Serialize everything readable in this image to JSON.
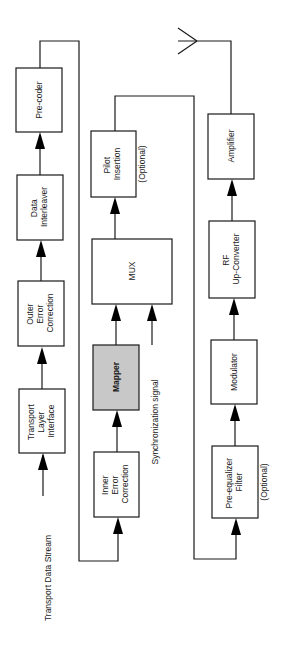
{
  "diagram": {
    "title": "",
    "orientation": "rotated-90-ccw",
    "highlight_color": "#c8c8c8",
    "line_color": "#1a1a1a",
    "blocks": [
      {
        "id": "transport-layer-interface",
        "lines": [
          "Transport",
          "Layer",
          "Interface"
        ]
      },
      {
        "id": "outer-error-correction",
        "lines": [
          "Outer",
          "Error",
          "Correction"
        ]
      },
      {
        "id": "data-interleaver",
        "lines": [
          "Data",
          "Interleaver"
        ]
      },
      {
        "id": "pre-coder",
        "lines": [
          "Pre-coder"
        ]
      },
      {
        "id": "inner-error-correction",
        "lines": [
          "Inner",
          "Error",
          "Correction"
        ]
      },
      {
        "id": "mapper",
        "lines": [
          "Mapper"
        ],
        "highlighted": true
      },
      {
        "id": "mux",
        "lines": [
          "MUX"
        ]
      },
      {
        "id": "pilot-insertion",
        "lines": [
          "Pilot",
          "Insertion"
        ],
        "note": "(Optional)"
      },
      {
        "id": "pre-equalizer-filter",
        "lines": [
          "Pre-equalizer",
          "Filter"
        ],
        "note": "(Optional)"
      },
      {
        "id": "modulator",
        "lines": [
          "Modulator"
        ]
      },
      {
        "id": "rf-up-converter",
        "lines": [
          "RF",
          "Up-Converter"
        ]
      },
      {
        "id": "amplifier",
        "lines": [
          "Amplifier"
        ]
      }
    ],
    "inputs": {
      "transport_data_stream": "Transport Data Stream",
      "synchronization_signal": "Synchronization signal"
    },
    "output": {
      "antenna": "antenna-icon"
    },
    "flow": [
      "Transport Data Stream",
      "Transport Layer Interface",
      "Outer Error Correction",
      "Data Interleaver",
      "Pre-coder",
      "Inner Error Correction",
      "Mapper",
      "MUX",
      "Pilot Insertion",
      "Pre-equalizer Filter",
      "Modulator",
      "RF Up-Converter",
      "Amplifier",
      "Antenna"
    ]
  }
}
